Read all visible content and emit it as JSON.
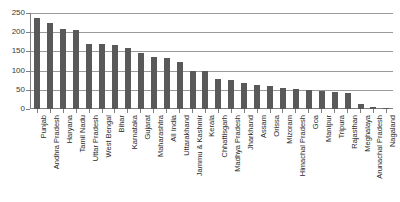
{
  "chart_data": {
    "type": "bar",
    "title": "",
    "xlabel": "",
    "ylabel": "",
    "ylim": [
      0,
      250
    ],
    "yticks": [
      0,
      50,
      100,
      150,
      200,
      250
    ],
    "grid": true,
    "legend": false,
    "bar_color": "#595959",
    "grid_color": "#9a9a9a",
    "axis_color": "#808080",
    "categories": [
      "Punjab",
      "Andhra Pradesh",
      "Haryana",
      "Tamil Nadu",
      "Uttar Pradesh",
      "West Bengal",
      "Bihar",
      "Karnataka",
      "Gujarat",
      "Maharashtra",
      "All India",
      "Uttarakhand",
      "Jammu & Kashmir",
      "Kerala",
      "Chhattisgarh",
      "Madhya Pradesh",
      "Jharkhand",
      "Assam",
      "Orissa",
      "Mizoram",
      "Himachal Pradesh",
      "Goa",
      "Manipur",
      "Tripura",
      "Rajasthan",
      "Meghalaya",
      "Arunachal Pradesh",
      "Nagaland"
    ],
    "values": [
      237,
      225,
      208,
      205,
      170,
      169,
      166,
      159,
      147,
      135,
      134,
      122,
      100,
      99,
      78,
      76,
      68,
      62,
      59,
      54,
      52,
      50,
      46,
      44,
      42,
      13,
      4,
      3
    ]
  }
}
